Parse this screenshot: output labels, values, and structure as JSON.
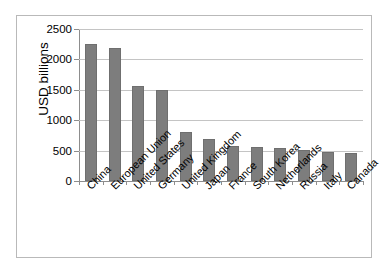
{
  "chart_data": {
    "type": "bar",
    "title": "",
    "subtitle": "",
    "xlabel": "",
    "ylabel": "USD billions",
    "ylim": [
      0,
      2500
    ],
    "yticks": [
      0,
      500,
      1000,
      1500,
      2000,
      2500
    ],
    "ytick_labels": [
      "0",
      "500",
      "1000",
      "1500",
      "2000",
      "2500"
    ],
    "grid": true,
    "legend": false,
    "legend_position": "none",
    "bar_color": "#7d7d7d",
    "categories": [
      "China",
      "European Union",
      "United States",
      "Germany",
      "United Kingdom",
      "Japan",
      "France",
      "South Korea",
      "Netherlands",
      "Russia",
      "Italy",
      "Canada"
    ],
    "values": [
      2250,
      2180,
      1570,
      1490,
      810,
      690,
      580,
      555,
      545,
      515,
      475,
      455
    ]
  },
  "colors": {
    "bar_fill": "#7d7d7d",
    "bar_edge": "#6f6f6f",
    "gridline": "#c4c4c4",
    "axis": "#8d8d8d",
    "frame": "#b9b9b9",
    "text": "#000000",
    "background": "#ffffff"
  }
}
